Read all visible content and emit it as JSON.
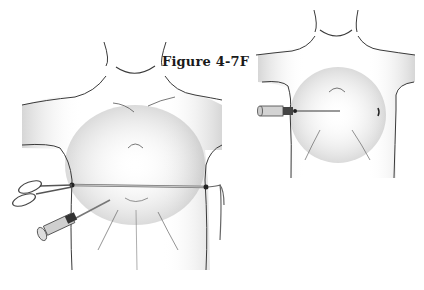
{
  "figure": {
    "label": "Figure 4-7F"
  },
  "illustrations": [
    {
      "name": "left-torso",
      "description": "Anterior torso with tube threaded transversely across lower chest, scissors clamping left end, tie on right end, and needle/syringe inserted lower left"
    },
    {
      "name": "right-torso",
      "description": "Anterior torso with needle/syringe inserted transversely at mid chest from left side"
    }
  ],
  "colors": {
    "line": "#3a3a3a",
    "shade": "#9a9a9a",
    "background": "#ffffff"
  }
}
